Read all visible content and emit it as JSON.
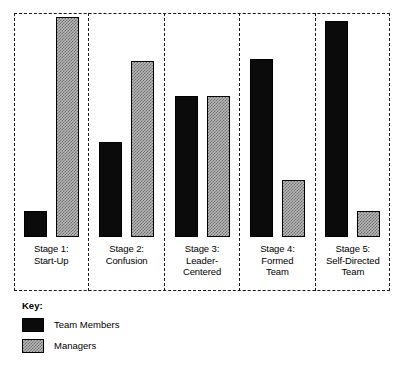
{
  "chart_data": {
    "type": "bar",
    "title": "",
    "subtitle": "",
    "xlabel": "",
    "ylabel": "",
    "ylim": [
      0,
      100
    ],
    "grid": false,
    "legend_position": "bottom-left",
    "categories": [
      "Stage 1:\nStart-Up",
      "Stage 2:\nConfusion",
      "Stage 3:\nLeader-\nCentered",
      "Stage 4:\nFormed\nTeam",
      "Stage 5:\nSelf-Directed\nTeam"
    ],
    "series": [
      {
        "name": "Team Members",
        "color": "#0b0b0b",
        "fill": "solid-black",
        "values": [
          12,
          43,
          64,
          81,
          98
        ]
      },
      {
        "name": "Managers",
        "color": "#b9b9b9",
        "fill": "dotted-grey",
        "values": [
          100,
          80,
          64,
          26,
          12
        ]
      }
    ],
    "annotations": []
  },
  "panels": [
    {
      "label": "Stage 1:\nStart-Up",
      "team_members": 12,
      "managers": 100
    },
    {
      "label": "Stage 2:\nConfusion",
      "team_members": 43,
      "managers": 80
    },
    {
      "label": "Stage 3:\nLeader-\nCentered",
      "team_members": 64,
      "managers": 64
    },
    {
      "label": "Stage 4:\nFormed\nTeam",
      "team_members": 81,
      "managers": 26
    },
    {
      "label": "Stage 5:\nSelf-Directed\nTeam",
      "team_members": 98,
      "managers": 12
    }
  ],
  "key": {
    "title": "Key:",
    "entries": [
      {
        "label": "Team Members",
        "swatch": "solid-black-swatch"
      },
      {
        "label": "Managers",
        "swatch": "dotted-grey-swatch"
      }
    ]
  },
  "colors": {
    "team_members": "#0b0b0b",
    "managers": "#b9b9b9",
    "managers_pattern": "#6f6f6f",
    "outline": "#000000",
    "frame": "#1a1a1a",
    "background": "#ffffff"
  }
}
